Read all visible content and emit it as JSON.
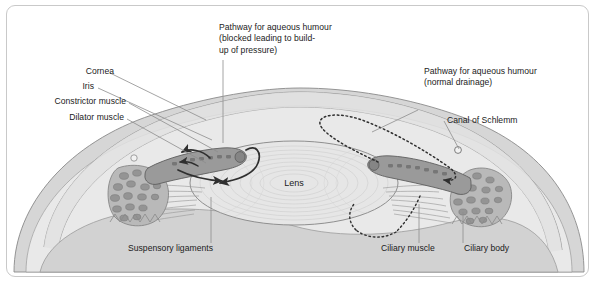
{
  "figure": {
    "border_color": "#c9c9c9",
    "background": "#ffffff"
  },
  "colors": {
    "outline": "#6e6e6e",
    "sclera_fill": "#d6d6d6",
    "cornea_fill": "#e4e4e4",
    "lens_fill": "#e6e6e6",
    "iris_fill": "#9a9a9a",
    "ciliary_fill": "#b5b5b5",
    "vitreous_fill": "#d2d2d2",
    "arrow": "#3a3a3a",
    "leader": "#7b7b7b",
    "text": "#1b1b1b"
  },
  "labels": {
    "cornea": "Cornea",
    "iris": "Iris",
    "constrictor_muscle": "Constrictor muscle",
    "dilator_muscle": "Dilator muscle",
    "pathway_blocked": "Pathway for aqueous humour\n(blocked leading to build-\nup of pressure)",
    "pathway_normal": "Pathway for aqueous humour\n(normal drainage)",
    "canal_of_schlemm": "Canal of Schlemm",
    "lens": "Lens",
    "suspensory_ligaments": "Suspensory ligaments",
    "ciliary_muscle": "Ciliary muscle",
    "ciliary_body": "Ciliary body"
  },
  "structures": [
    {
      "name": "cornea",
      "label": "Cornea"
    },
    {
      "name": "iris",
      "label": "Iris"
    },
    {
      "name": "constrictor-muscle",
      "label": "Constrictor muscle"
    },
    {
      "name": "dilator-muscle",
      "label": "Dilator muscle"
    },
    {
      "name": "lens",
      "label": "Lens"
    },
    {
      "name": "canal-of-schlemm",
      "label": "Canal of Schlemm"
    },
    {
      "name": "suspensory-ligaments",
      "label": "Suspensory ligaments"
    },
    {
      "name": "ciliary-muscle",
      "label": "Ciliary muscle"
    },
    {
      "name": "ciliary-body",
      "label": "Ciliary body"
    }
  ],
  "pathways": [
    {
      "name": "blocked-pathway",
      "style": "solid-arrows",
      "label": "Pathway for aqueous humour (blocked leading to build-up of pressure)",
      "side": "left"
    },
    {
      "name": "normal-drainage-pathway",
      "style": "dotted-loop-arrow",
      "label": "Pathway for aqueous humour (normal drainage)",
      "side": "right"
    }
  ]
}
